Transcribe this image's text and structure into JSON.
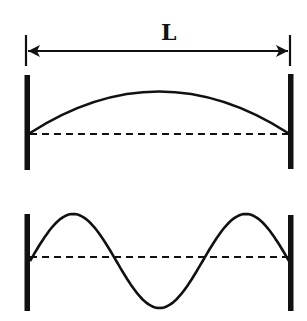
{
  "diagram": {
    "type": "standing-waves-on-string",
    "length_label": "L",
    "colors": {
      "stroke": "#111111",
      "background": "#ffffff"
    },
    "panels": [
      {
        "name": "fundamental",
        "description": "String fixed at both ends vibrating in first harmonic (half wavelength)",
        "harmonic": 1
      },
      {
        "name": "third-harmonic",
        "description": "String fixed at both ends vibrating in third harmonic (one and a half wavelengths)",
        "harmonic": 3
      }
    ]
  }
}
